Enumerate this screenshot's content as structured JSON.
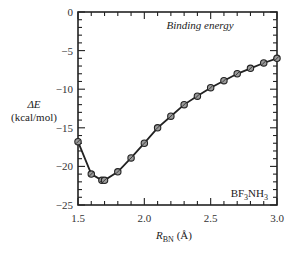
{
  "chart_data": {
    "type": "line",
    "title": "Binding energy",
    "annotation": "BF3NH3",
    "xlabel": "R_BN (Å)",
    "ylabel": "ΔE (kcal/mol)",
    "xlim": [
      1.5,
      3.0
    ],
    "ylim": [
      -25,
      0
    ],
    "x_ticks": [
      1.5,
      2.0,
      2.5,
      3.0
    ],
    "x_tick_labels": [
      "1.5",
      "2.0",
      "2.5",
      "3.0"
    ],
    "x_minor_step": 0.1,
    "y_ticks": [
      0,
      -5,
      -10,
      -15,
      -20,
      -25
    ],
    "y_tick_labels": [
      "0",
      "−5",
      "−10",
      "−15",
      "−20",
      "−25"
    ],
    "y_minor_step": 1,
    "grid": false,
    "legend": null,
    "series": [
      {
        "name": "BF3NH3",
        "marker": "circle-cross",
        "x": [
          1.5,
          1.6,
          1.68,
          1.7,
          1.8,
          1.9,
          2.0,
          2.1,
          2.2,
          2.3,
          2.4,
          2.5,
          2.6,
          2.7,
          2.8,
          2.9,
          3.0
        ],
        "y": [
          -16.8,
          -21.0,
          -21.8,
          -21.8,
          -20.7,
          -18.9,
          -17.0,
          -15.0,
          -13.5,
          -12.0,
          -10.9,
          -9.8,
          -8.9,
          -8.0,
          -7.3,
          -6.6,
          -6.0
        ]
      }
    ]
  },
  "labels": {
    "title": "Binding energy",
    "ylabel_line1": "ΔE",
    "ylabel_line2": "(kcal/mol)",
    "xlabel_main": "R",
    "xlabel_sub": "BN",
    "xlabel_unit": " (Å)",
    "annot_bf": "BF",
    "annot_3a": "3",
    "annot_nh": "NH",
    "annot_3b": "3"
  },
  "colors": {
    "line": "#222222",
    "marker_fill": "#9a9a9a",
    "axis": "#222222",
    "background": "#ffffff"
  }
}
